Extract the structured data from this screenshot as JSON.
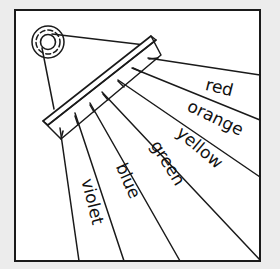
{
  "diagram": {
    "colors": {
      "background": "#ececec",
      "panel": "#ffffff",
      "ink": "#1a1a1a"
    },
    "light_source": {
      "icon": "light-source-icon",
      "description": "concentric circles representing a light source"
    },
    "prism": {
      "icon": "prism-icon",
      "description": "rectangular prism block receiving a beam of light"
    },
    "spectrum_labels": {
      "red": "red",
      "orange": "orange",
      "yellow": "yellow",
      "green": "green",
      "blue": "blue",
      "violet": "violet"
    }
  }
}
